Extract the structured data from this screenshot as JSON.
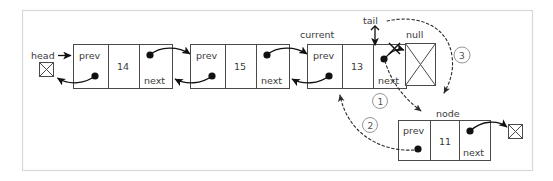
{
  "diagram": {
    "frame": {
      "stroke": "#d8d8d8"
    },
    "colors": {
      "box_stroke": "#4a4a4a",
      "arrow_solid": "#111111",
      "arrow_dashed": "#2b2b2b",
      "text": "#3a3a3a",
      "step_circle": "#8a8a8a",
      "background": "#ffffff"
    },
    "pointer_labels": {
      "head": "head",
      "current": "current",
      "tail": "tail",
      "null_top": "null",
      "node": "node"
    },
    "nodes": [
      {
        "id": "n14",
        "prev_label": "prev",
        "value": "14",
        "next_label": "next"
      },
      {
        "id": "n15",
        "prev_label": "prev",
        "value": "15",
        "next_label": "next"
      },
      {
        "id": "n13",
        "prev_label": "prev",
        "value": "13",
        "next_label": "next"
      },
      {
        "id": "n11",
        "prev_label": "prev",
        "value": "11",
        "next_label": "next"
      }
    ],
    "steps": [
      {
        "number": "1",
        "meaning": "node.prev-assigned-from-current-next-region"
      },
      {
        "number": "2",
        "meaning": "current-linked-from-new-node-prev"
      },
      {
        "number": "3",
        "meaning": "tail-moves-past-null-to-new-node"
      }
    ]
  }
}
